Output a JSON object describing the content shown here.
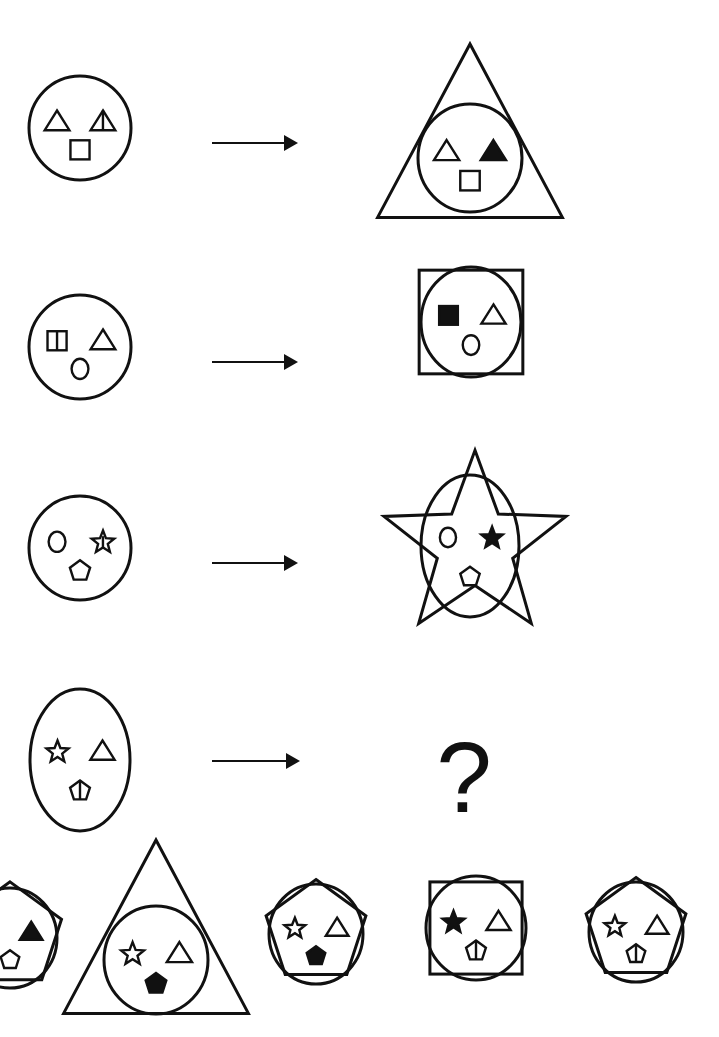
{
  "puzzle": {
    "type": "figure-analogy",
    "ink_color": "#111111",
    "background": "#ffffff",
    "question_mark": "?",
    "rule_examples": [
      {
        "input": {
          "outline": "circle",
          "top_left": "triangle",
          "top_right": "triangle-divided",
          "bottom": "square"
        },
        "output": {
          "outer": "triangle",
          "top_left": "triangle",
          "top_right": "triangle-filled",
          "bottom": "square"
        }
      },
      {
        "input": {
          "outline": "circle",
          "top_left": "square-divided",
          "top_right": "triangle",
          "bottom": "circle"
        },
        "output": {
          "outer": "square",
          "top_left": "square-filled",
          "top_right": "triangle",
          "bottom": "circle"
        }
      },
      {
        "input": {
          "outline": "circle",
          "top_left": "circle",
          "top_right": "star-divided",
          "bottom": "pentagon"
        },
        "output": {
          "outer": "star",
          "top_left": "circle",
          "top_right": "star-filled",
          "bottom": "pentagon"
        }
      }
    ],
    "question": {
      "input": {
        "outline": "circle",
        "top_left": "star",
        "top_right": "triangle",
        "bottom": "pentagon-divided"
      },
      "output": "unknown"
    },
    "options": [
      {
        "outer": "pentagon",
        "top_left": "pentagon",
        "top_right": "triangle-filled",
        "bottom": "pentagon",
        "partially_visible": true
      },
      {
        "outer": "triangle",
        "top_left": "star",
        "top_right": "triangle",
        "bottom": "pentagon-filled"
      },
      {
        "outer": "pentagon",
        "top_left": "star",
        "top_right": "triangle",
        "bottom": "pentagon-filled"
      },
      {
        "outer": "square",
        "top_left": "star-filled",
        "top_right": "triangle",
        "bottom": "pentagon-divided"
      },
      {
        "outer": "pentagon",
        "top_left": "star",
        "top_right": "triangle",
        "bottom": "pentagon-divided"
      }
    ]
  }
}
